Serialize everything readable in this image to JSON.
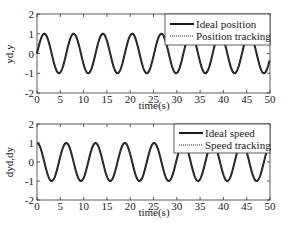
{
  "chart_data": [
    {
      "type": "line",
      "title": "",
      "xlabel": "time(s)",
      "ylabel": "yd,y",
      "xlim": [
        0,
        50
      ],
      "ylim": [
        -2,
        2
      ],
      "xticks": [
        0,
        5,
        10,
        15,
        20,
        25,
        30,
        35,
        40,
        45,
        50
      ],
      "yticks": [
        -2,
        -1,
        0,
        1,
        2
      ],
      "grid": false,
      "legend_position": "upper right",
      "series": [
        {
          "name": "Ideal position",
          "style": "solid",
          "function": "sin(t)",
          "amplitude": 1,
          "period": 6.283
        },
        {
          "name": "Position tracking",
          "style": "dotted",
          "function": "approx sin(t)",
          "amplitude": 1,
          "period": 6.283
        }
      ]
    },
    {
      "type": "line",
      "title": "",
      "xlabel": "time(s)",
      "ylabel": "dyd,dy",
      "xlim": [
        0,
        50
      ],
      "ylim": [
        -2,
        2
      ],
      "xticks": [
        0,
        5,
        10,
        15,
        20,
        25,
        30,
        35,
        40,
        45,
        50
      ],
      "yticks": [
        -2,
        -1,
        0,
        1,
        2
      ],
      "grid": false,
      "legend_position": "upper right",
      "series": [
        {
          "name": "Ideal speed",
          "style": "solid",
          "function": "cos(t)",
          "amplitude": 1,
          "period": 6.283
        },
        {
          "name": "Speed tracking",
          "style": "dotted",
          "function": "approx cos(t)",
          "amplitude": 1,
          "period": 6.283
        }
      ]
    }
  ],
  "plots": [
    {
      "ylabel": "yd,y",
      "xlabel": "time(s)",
      "legend": [
        "Ideal position",
        "Position tracking"
      ],
      "xtick_labels": [
        "0",
        "5",
        "10",
        "15",
        "20",
        "25",
        "30",
        "35",
        "40",
        "45",
        "50"
      ],
      "ytick_labels": [
        "2",
        "1",
        "0",
        "-1",
        "-2"
      ]
    },
    {
      "ylabel": "dyd,dy",
      "xlabel": "time(s)",
      "legend": [
        "Ideal speed",
        "Speed tracking"
      ],
      "xtick_labels": [
        "0",
        "5",
        "10",
        "15",
        "20",
        "25",
        "30",
        "35",
        "40",
        "45",
        "50"
      ],
      "ytick_labels": [
        "2",
        "1",
        "0",
        "-1",
        "-2"
      ]
    }
  ],
  "colors": {
    "line": "#1a1a1a",
    "axis": "#333333",
    "background": "#ffffff"
  }
}
